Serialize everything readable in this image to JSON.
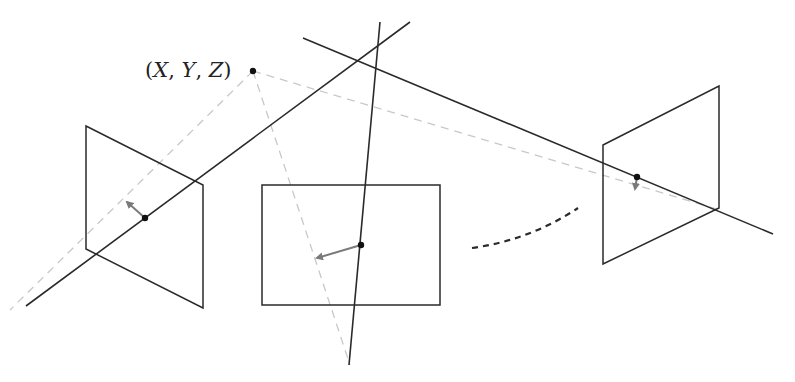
{
  "diagram": {
    "type": "multi-view camera geometry / bundle adjustment illustration",
    "point_label": {
      "open": "(",
      "x": "X",
      "sep1": ", ",
      "y": "Y",
      "sep2": ", ",
      "z": "Z",
      "close": ")"
    },
    "world_point": {
      "x": 253,
      "y": 71
    },
    "colors": {
      "line": "#2a2a2a",
      "dashed": "#c8c8c8",
      "arrow": "#7a7a7a",
      "dot": "#111111"
    },
    "cameras": [
      {
        "name": "left-image-plane",
        "corners": [
          [
            86,
            126
          ],
          [
            203,
            185
          ],
          [
            203,
            308
          ],
          [
            86,
            249
          ]
        ],
        "projection": [
          145,
          218
        ],
        "arrow_tip": [
          125,
          200
        ]
      },
      {
        "name": "middle-image-plane",
        "corners": [
          [
            262,
            185
          ],
          [
            440,
            185
          ],
          [
            440,
            305
          ],
          [
            262,
            305
          ]
        ],
        "projection": [
          361,
          245
        ],
        "arrow_tip": [
          315,
          259
        ]
      },
      {
        "name": "right-image-plane",
        "corners": [
          [
            603,
            145
          ],
          [
            719,
            86
          ],
          [
            719,
            208
          ],
          [
            603,
            264
          ]
        ],
        "projection": [
          637,
          177
        ],
        "arrow_tip": [
          634,
          189
        ]
      }
    ],
    "rays": [
      {
        "name": "ray-left",
        "from": [
          26,
          306
        ],
        "to": [
          410,
          22
        ]
      },
      {
        "name": "ray-middle",
        "from": [
          380,
          22
        ],
        "to": [
          349,
          365
        ]
      },
      {
        "name": "ray-right",
        "from": [
          303,
          38
        ],
        "to": [
          773,
          234
        ]
      }
    ],
    "dashed_projections": [
      {
        "name": "dashed-to-left",
        "from": [
          253,
          71
        ],
        "to": [
          10,
          310
        ]
      },
      {
        "name": "dashed-to-middle",
        "from": [
          253,
          71
        ],
        "to": [
          350,
          365
        ]
      },
      {
        "name": "dashed-to-right",
        "from": [
          253,
          71
        ],
        "to": [
          720,
          210
        ]
      }
    ],
    "ellipsis_curve": {
      "from": [
        472,
        248
      ],
      "to": [
        578,
        208
      ],
      "meaning": "more cameras"
    }
  }
}
